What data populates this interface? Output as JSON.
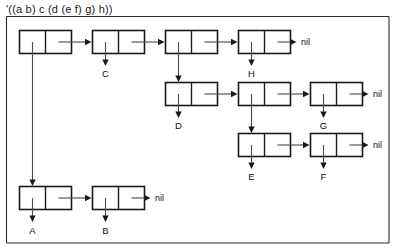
{
  "diagram": {
    "title": "'((a b) c (d (e f) g) h))",
    "type": "cons-cell-box-and-pointer",
    "nil_label": "nil",
    "rows": [
      {
        "id": "top-row",
        "y": 30,
        "cells": [
          {
            "id": "top-1",
            "x": 19,
            "car": "down-to-a-row",
            "car_label": ""
          },
          {
            "id": "top-2",
            "x": 92,
            "car": "atom",
            "car_label": "C"
          },
          {
            "id": "top-3",
            "x": 165,
            "car": "down-to-d-row",
            "car_label": ""
          },
          {
            "id": "top-4",
            "x": 238,
            "car": "atom",
            "car_label": "H"
          }
        ],
        "terminator": "nil",
        "terminator_x": 300
      },
      {
        "id": "middle-row",
        "y": 82,
        "cells": [
          {
            "id": "mid-1",
            "x": 165,
            "car": "atom",
            "car_label": "D"
          },
          {
            "id": "mid-2",
            "x": 238,
            "car": "down-to-e-row",
            "car_label": ""
          },
          {
            "id": "mid-3",
            "x": 310,
            "car": "atom",
            "car_label": "G"
          }
        ],
        "terminator": "nil",
        "terminator_x": 372
      },
      {
        "id": "lower-row",
        "y": 133,
        "cells": [
          {
            "id": "low-1",
            "x": 238,
            "car": "atom",
            "car_label": "E"
          },
          {
            "id": "low-2",
            "x": 310,
            "car": "atom",
            "car_label": "F"
          }
        ],
        "terminator": "nil",
        "terminator_x": 372
      },
      {
        "id": "bottom-row",
        "y": 186,
        "cells": [
          {
            "id": "bot-1",
            "x": 19,
            "car": "atom",
            "car_label": "A"
          },
          {
            "id": "bot-2",
            "x": 92,
            "car": "atom",
            "car_label": "B"
          }
        ],
        "terminator": "nil",
        "terminator_x": 154
      }
    ],
    "atom_labels": [
      "A",
      "B",
      "C",
      "D",
      "E",
      "F",
      "G",
      "H"
    ],
    "nil_labels": [
      "nil",
      "nil",
      "nil",
      "nil"
    ],
    "colors": {
      "background": "#ffffff",
      "cell_stroke": "#1a1a1a",
      "pointer_stroke": "#4a4a4a",
      "frame_stroke": "#2b2b2b",
      "text": "#111111"
    }
  }
}
